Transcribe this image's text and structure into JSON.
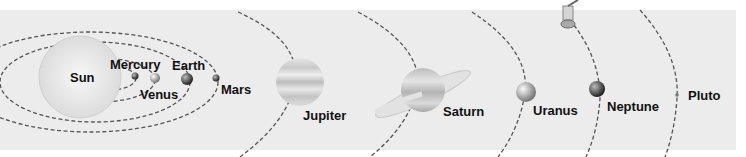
{
  "diagram": {
    "background_color": "#ececec",
    "orbit_color": "#555555",
    "bodies": [
      {
        "name": "Sun",
        "label": "Sun"
      },
      {
        "name": "Mercury",
        "label": "Mercury"
      },
      {
        "name": "Venus",
        "label": "Venus"
      },
      {
        "name": "Earth",
        "label": "Earth"
      },
      {
        "name": "Mars",
        "label": "Mars"
      },
      {
        "name": "Jupiter",
        "label": "Jupiter"
      },
      {
        "name": "Saturn",
        "label": "Saturn"
      },
      {
        "name": "Uranus",
        "label": "Uranus"
      },
      {
        "name": "Neptune",
        "label": "Neptune"
      },
      {
        "name": "Pluto",
        "label": "Pluto"
      }
    ],
    "extras": [
      {
        "name": "space-probe",
        "description": "satellite / space probe near Neptune orbit"
      }
    ]
  }
}
